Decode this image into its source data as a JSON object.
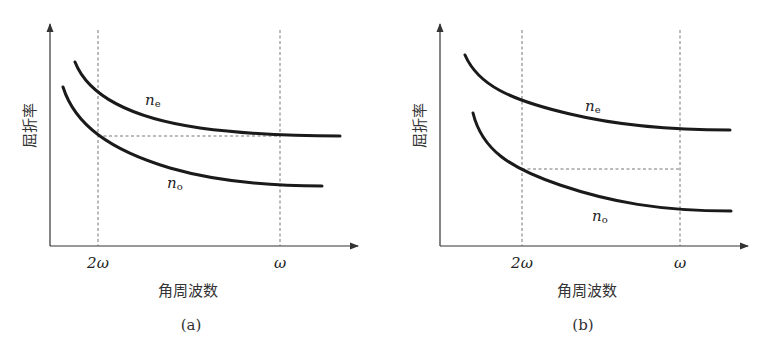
{
  "figure": {
    "panels": [
      {
        "id": "a",
        "caption": "(a)",
        "ylabel": "屈折率",
        "xlabel": "角周波数",
        "xticks": [
          {
            "label": "2ω",
            "prefix": "2",
            "symbol": "ω"
          },
          {
            "label": "ω",
            "prefix": "",
            "symbol": "ω"
          }
        ],
        "curves": [
          {
            "name": "n_e",
            "label_main": "n",
            "label_sub": "e"
          },
          {
            "name": "n_o",
            "label_main": "n",
            "label_sub": "o"
          }
        ],
        "note": "n_e at ω equals n_o at 2ω (dashed horizontal guide)"
      },
      {
        "id": "b",
        "caption": "(b)",
        "ylabel": "屈折率",
        "xlabel": "角周波数",
        "xticks": [
          {
            "label": "2ω",
            "prefix": "2",
            "symbol": "ω"
          },
          {
            "label": "ω",
            "prefix": "",
            "symbol": "ω"
          }
        ],
        "curves": [
          {
            "name": "n_e",
            "label_main": "n",
            "label_sub": "e"
          },
          {
            "name": "n_o",
            "label_main": "n",
            "label_sub": "o"
          }
        ],
        "note": "dashed horizontal guide from n_o at 2ω to ω line"
      }
    ],
    "colors": {
      "curve": "#1a1a1a",
      "axis": "#333333",
      "guide": "#666666",
      "background": "#ffffff"
    }
  }
}
